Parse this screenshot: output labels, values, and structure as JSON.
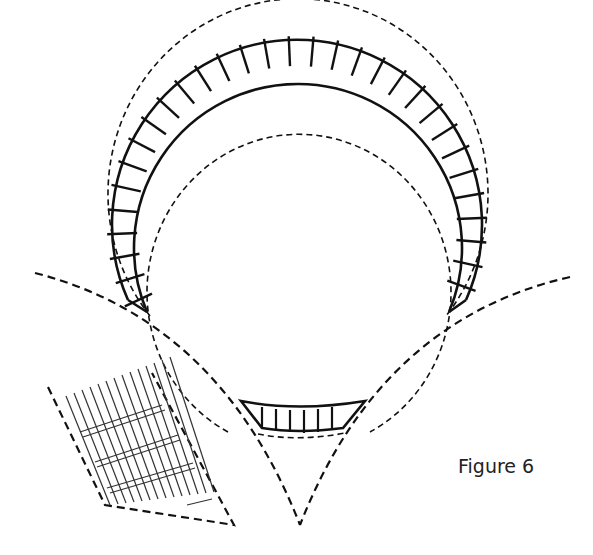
{
  "figure": {
    "caption": "Figure 6",
    "elements": [
      "circular-ladder-ring",
      "bottom-ladder-segment",
      "intersecting-dashed-arcs",
      "crosshatch-grid-panel"
    ]
  }
}
